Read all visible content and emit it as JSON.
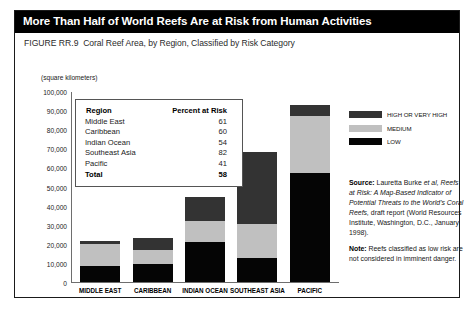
{
  "header": {
    "title": "More Than Half of World Reefs Are at Risk from Human Activities",
    "figure_number": "FIGURE RR.9",
    "subtitle": "Coral Reef Area, by Region, Classified by Risk Category"
  },
  "axis": {
    "units_label": "(square kilometers)",
    "y_ticks": [
      "100,000",
      "90,000",
      "80,000",
      "70,000",
      "60,000",
      "50,000",
      "40,000",
      "30,000",
      "20,000",
      "10,000",
      "0"
    ]
  },
  "inset_table": {
    "header_region": "Region",
    "header_percent": "Percent at Risk",
    "rows": [
      {
        "region": "Middle East",
        "percent": "61"
      },
      {
        "region": "Caribbean",
        "percent": "60"
      },
      {
        "region": "Indian Ocean",
        "percent": "54"
      },
      {
        "region": "Southeast Asia",
        "percent": "82"
      },
      {
        "region": "Pacific",
        "percent": "41"
      }
    ],
    "total_label": "Total",
    "total_percent": "58"
  },
  "legend": {
    "items": [
      {
        "label": "HIGH OR VERY HIGH",
        "color": "#333333"
      },
      {
        "label": "MEDIUM",
        "color": "#c0c0c0"
      },
      {
        "label": "LOW",
        "color": "#050505"
      }
    ]
  },
  "notes": {
    "source_lead": "Source:",
    "source_text_1": " Lauretta Burke ",
    "source_text_ital_1": "et al,",
    "source_ital_2": "Reefs at Risk: A Map-Based Indicator of Potential Threats to the World's Coral Reefs,",
    "source_text_2": " draft report (World Resources Institute, Washington, D.C., January 1998).",
    "note_lead": "Note:",
    "note_text": " Reefs classified as low risk are not considered in imminent danger."
  },
  "chart_data": {
    "type": "bar",
    "title": "Coral Reef Area, by Region, Classified by Risk Category",
    "xlabel": "",
    "ylabel": "(square kilometers)",
    "ylim": [
      0,
      100000
    ],
    "ytick_interval": 10000,
    "grid": false,
    "stacked": true,
    "legend_position": "right",
    "categories": [
      "MIDDLE EAST",
      "CARIBBEAN",
      "INDIAN OCEAN",
      "SOUTHEAST ASIA",
      "PACIFIC"
    ],
    "series": [
      {
        "name": "LOW",
        "color": "#050505",
        "values": [
          8500,
          9300,
          20700,
          12500,
          57000
        ]
      },
      {
        "name": "MEDIUM",
        "color": "#c0c0c0",
        "values": [
          11500,
          7700,
          11300,
          18000,
          30000
        ]
      },
      {
        "name": "HIGH OR VERY HIGH",
        "color": "#333333",
        "values": [
          1500,
          6300,
          12500,
          37500,
          5500
        ]
      }
    ],
    "totals": [
      21500,
      23300,
      44500,
      68000,
      92500
    ],
    "percent_at_risk": {
      "Middle East": 61,
      "Caribbean": 60,
      "Indian Ocean": 54,
      "Southeast Asia": 82,
      "Pacific": 41,
      "Total": 58
    }
  }
}
